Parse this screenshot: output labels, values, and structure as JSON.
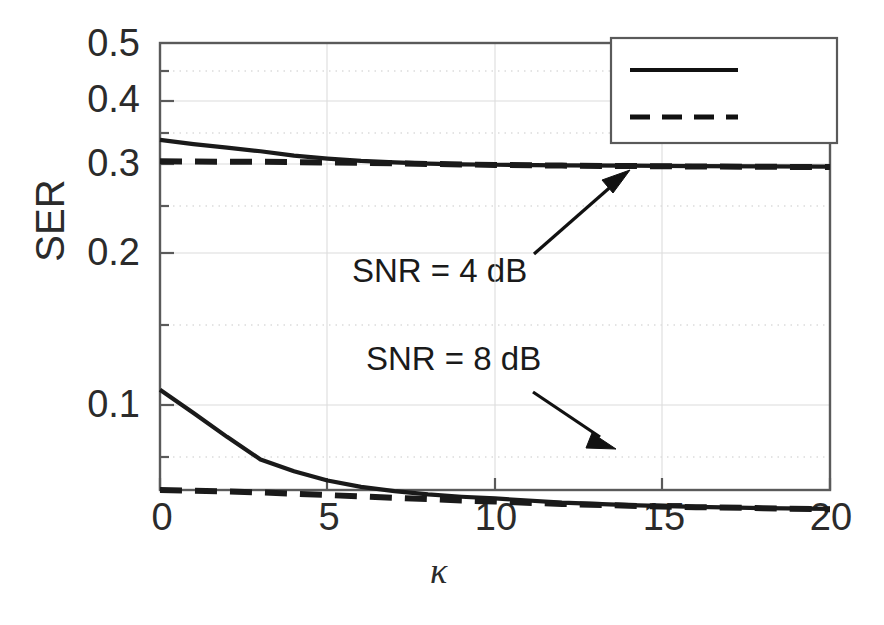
{
  "chart_data": {
    "type": "line",
    "title": "",
    "xlabel": "κ",
    "ylabel": "SER",
    "yscale": "log",
    "xlim": [
      0,
      20
    ],
    "ylim": [
      0.055,
      0.52
    ],
    "grid": true,
    "x_ticks": [
      0,
      5,
      10,
      15,
      20
    ],
    "x_tick_labels": [
      "0",
      "5",
      "10",
      "15",
      "20"
    ],
    "y_ticks": [
      0.1,
      0.2,
      0.3,
      0.4,
      0.5
    ],
    "y_tick_labels": [
      "0.1",
      "0.2",
      "0.3",
      "0.4",
      "0.5"
    ],
    "legend_position": "top-right",
    "series": [
      {
        "name": "μ = 2",
        "style": "solid",
        "group": "SNR = 4 dB",
        "x": [
          0,
          1,
          2,
          3,
          4,
          5,
          6,
          7,
          8,
          9,
          10,
          12,
          14,
          16,
          18,
          20
        ],
        "y": [
          0.325,
          0.319,
          0.314,
          0.309,
          0.303,
          0.299,
          0.296,
          0.294,
          0.2925,
          0.2915,
          0.291,
          0.2902,
          0.2898,
          0.2893,
          0.2888,
          0.2885
        ]
      },
      {
        "name": "μ = 6",
        "style": "dashed",
        "group": "SNR = 4 dB",
        "x": [
          0,
          1,
          2,
          3,
          4,
          5,
          6,
          7,
          8,
          9,
          10,
          12,
          14,
          16,
          18,
          20
        ],
        "y": [
          0.2955,
          0.2952,
          0.295,
          0.2948,
          0.2944,
          0.294,
          0.2934,
          0.2928,
          0.2921,
          0.2914,
          0.2908,
          0.2899,
          0.2893,
          0.2888,
          0.2884,
          0.288
        ]
      },
      {
        "name": "μ = 2",
        "style": "solid",
        "group": "SNR = 8 dB",
        "x": [
          0,
          1,
          2,
          3,
          4,
          5,
          6,
          7,
          8,
          9,
          10,
          12,
          14,
          16,
          18,
          20
        ],
        "y": [
          0.107,
          0.0965,
          0.0868,
          0.0785,
          0.0745,
          0.0715,
          0.0695,
          0.0682,
          0.0672,
          0.0665,
          0.066,
          0.0648,
          0.0641,
          0.0636,
          0.0632,
          0.063
        ]
      },
      {
        "name": "μ = 6",
        "style": "dashed",
        "group": "SNR = 8 dB",
        "x": [
          0,
          1,
          2,
          3,
          4,
          5,
          6,
          7,
          8,
          9,
          10,
          12,
          14,
          16,
          18,
          20
        ],
        "y": [
          0.0685,
          0.0683,
          0.0681,
          0.0678,
          0.0674,
          0.067,
          0.0666,
          0.0662,
          0.0658,
          0.0654,
          0.0651,
          0.0644,
          0.0639,
          0.0635,
          0.0632,
          0.0629
        ]
      }
    ],
    "annotations": [
      {
        "text": "SNR = 4 dB",
        "x": 5.2,
        "y": 0.205,
        "arrow_to_x": 14.0,
        "arrow_to_y": 0.289
      },
      {
        "text": "SNR = 8 dB",
        "x": 5.6,
        "y": 0.118,
        "arrow_to_x": 13.5,
        "arrow_to_y": 0.0645
      }
    ],
    "legend": [
      {
        "label": "μ = 2",
        "mu": "μ",
        "eq": "= 2",
        "style": "solid"
      },
      {
        "label": "μ = 6",
        "mu": "μ",
        "eq": "= 6",
        "style": "dashed"
      }
    ],
    "colors": {
      "line": "#1a1a1a",
      "axis": "#595959",
      "grid": "#b8b8b8",
      "text": "#2b2b2b"
    }
  }
}
